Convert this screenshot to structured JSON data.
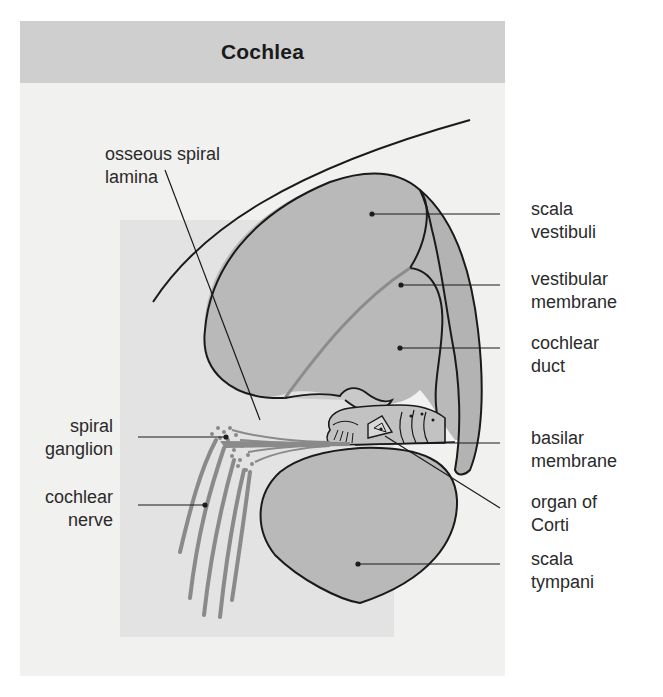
{
  "figure": {
    "title": "Cochlea",
    "colors": {
      "header_bg": "#cfcfcf",
      "frame_bg": "#f1f1f0",
      "panel_bg": "#e3e3e3",
      "chamber_fill": "#b9b9b9",
      "nerve_fill": "#8a8a8a",
      "outline": "#1a1a1a"
    },
    "labels": {
      "osseous_spiral_lamina": [
        "osseous spiral",
        "lamina"
      ],
      "scala_vestibuli": [
        "scala",
        "vestibuli"
      ],
      "vestibular_membrane": [
        "vestibular",
        "membrane"
      ],
      "cochlear_duct": [
        "cochlear",
        "duct"
      ],
      "spiral_ganglion": [
        "spiral",
        "ganglion"
      ],
      "basilar_membrane": [
        "basilar",
        "membrane"
      ],
      "cochlear_nerve": [
        "cochlear",
        "nerve"
      ],
      "organ_of_corti": [
        "organ of",
        "Corti"
      ],
      "scala_tympani": [
        "scala",
        "tympani"
      ]
    }
  }
}
